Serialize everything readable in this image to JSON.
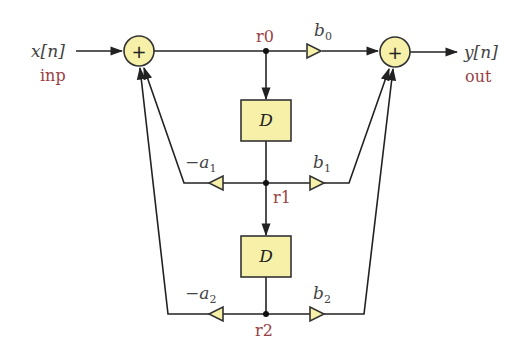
{
  "diagram": {
    "colors": {
      "block_fill": "#f6f0a8",
      "signal_label": "#9a3f46",
      "wire": "#222222"
    },
    "input": {
      "symbol": "x[n]",
      "name": "inp"
    },
    "output": {
      "symbol": "y[n]",
      "name": "out"
    },
    "adders": [
      {
        "id": "left_adder",
        "symbol": "+"
      },
      {
        "id": "right_adder",
        "symbol": "+"
      }
    ],
    "delays": [
      {
        "id": "delay1",
        "label": "D"
      },
      {
        "id": "delay2",
        "label": "D"
      }
    ],
    "nodes": [
      {
        "id": "r0",
        "label": "r0"
      },
      {
        "id": "r1",
        "label": "r1"
      },
      {
        "id": "r2",
        "label": "r2"
      }
    ],
    "gains": {
      "b0": {
        "base": "b",
        "sub": "0"
      },
      "b1": {
        "base": "b",
        "sub": "1"
      },
      "b2": {
        "base": "b",
        "sub": "2"
      },
      "a1": {
        "base": "−a",
        "sub": "1"
      },
      "a2": {
        "base": "−a",
        "sub": "2"
      }
    }
  }
}
